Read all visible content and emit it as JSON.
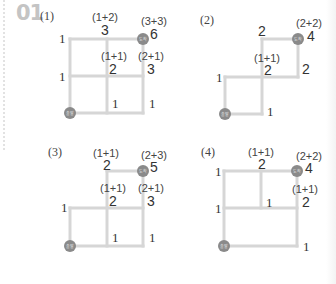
{
  "problem": {
    "number": "01"
  },
  "colors": {
    "path_line": "#d6d6d6",
    "marker_fill": "#8a8a8a",
    "marker_text": "#e6e6e6"
  },
  "markers": {
    "start": "출발",
    "end": "도착"
  },
  "panels": [
    {
      "label": "(1)",
      "edge_labels": [
        "1",
        "1",
        "1",
        "1"
      ],
      "nodes": [
        {
          "sum": "(1+2)",
          "value": "3"
        },
        {
          "sum": "(3+3)",
          "value": "6"
        },
        {
          "sum": "(1+1)",
          "value": "2"
        },
        {
          "sum": "(2+1)",
          "value": "3"
        }
      ]
    },
    {
      "label": "(2)",
      "edge_labels": [
        "1",
        "1",
        "2"
      ],
      "nodes": [
        {
          "sum": "",
          "value": "2"
        },
        {
          "sum": "(2+2)",
          "value": "4"
        },
        {
          "sum": "(1+1)",
          "value": "2"
        }
      ]
    },
    {
      "label": "(3)",
      "edge_labels": [
        "1",
        "1",
        "1"
      ],
      "nodes": [
        {
          "sum": "(1+1)",
          "value": "2"
        },
        {
          "sum": "(2+3)",
          "value": "5"
        },
        {
          "sum": "(1+1)",
          "value": "2"
        },
        {
          "sum": "(2+1)",
          "value": "3"
        }
      ]
    },
    {
      "label": "(4)",
      "edge_labels": [
        "1",
        "1",
        "1",
        "1"
      ],
      "nodes": [
        {
          "sum": "(1+1)",
          "value": "2"
        },
        {
          "sum": "(2+2)",
          "value": "4"
        },
        {
          "sum": "(1+1)",
          "value": "2"
        }
      ]
    }
  ]
}
